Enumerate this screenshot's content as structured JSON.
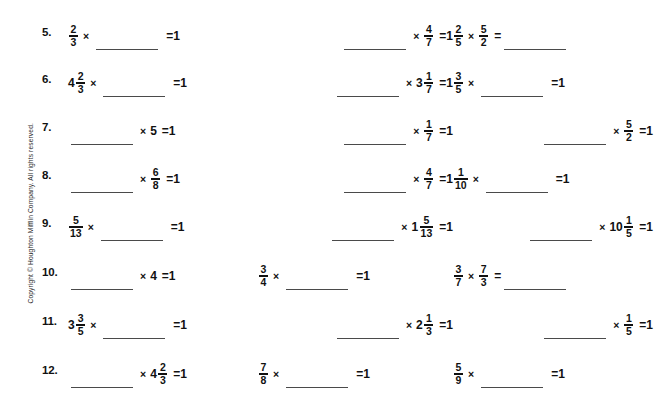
{
  "page": {
    "background_color": "#ffffff",
    "text_color": "#111111",
    "rule_color": "#4a4a4a"
  },
  "copyright": {
    "text": "Copyright © Houghton Mifflin Company. All rights reserved.",
    "orientation": "vertical-rotated-90-ccw"
  },
  "worksheet": {
    "blank_label": "",
    "multiply_symbol": "×",
    "equals_symbol": "=",
    "result_value": "1",
    "rows": [
      {
        "number": "5.",
        "columns": [
          {
            "id": "5a",
            "parts": [
              {
                "kind": "fraction",
                "numerator": "2",
                "denominator": "3"
              },
              {
                "kind": "op",
                "text": "×"
              },
              {
                "kind": "blank"
              },
              {
                "kind": "eq",
                "text": "="
              },
              {
                "kind": "number",
                "text": "1"
              }
            ]
          },
          {
            "id": "5b",
            "align": "right",
            "parts": [
              {
                "kind": "blank"
              },
              {
                "kind": "op",
                "text": "×"
              },
              {
                "kind": "fraction",
                "numerator": "4",
                "denominator": "7"
              },
              {
                "kind": "eq",
                "text": "="
              },
              {
                "kind": "number",
                "text": "1"
              }
            ]
          },
          {
            "id": "5c",
            "parts": [
              {
                "kind": "fraction",
                "numerator": "2",
                "denominator": "5"
              },
              {
                "kind": "op",
                "text": "×"
              },
              {
                "kind": "fraction",
                "numerator": "5",
                "denominator": "2"
              },
              {
                "kind": "eq",
                "text": "="
              },
              {
                "kind": "blank"
              }
            ]
          }
        ]
      },
      {
        "number": "6.",
        "columns": [
          {
            "id": "6a",
            "parts": [
              {
                "kind": "mixed",
                "whole": "4",
                "numerator": "2",
                "denominator": "3"
              },
              {
                "kind": "op",
                "text": "×"
              },
              {
                "kind": "blank"
              },
              {
                "kind": "eq",
                "text": "="
              },
              {
                "kind": "number",
                "text": "1"
              }
            ]
          },
          {
            "id": "6b",
            "align": "right",
            "parts": [
              {
                "kind": "blank"
              },
              {
                "kind": "op",
                "text": "×"
              },
              {
                "kind": "mixed",
                "whole": "3",
                "numerator": "1",
                "denominator": "7"
              },
              {
                "kind": "eq",
                "text": "="
              },
              {
                "kind": "number",
                "text": "1"
              }
            ]
          },
          {
            "id": "6c",
            "parts": [
              {
                "kind": "fraction",
                "numerator": "3",
                "denominator": "5"
              },
              {
                "kind": "op",
                "text": "×"
              },
              {
                "kind": "blank"
              },
              {
                "kind": "eq",
                "text": "="
              },
              {
                "kind": "number",
                "text": "1"
              }
            ]
          }
        ]
      },
      {
        "number": "7.",
        "columns": [
          {
            "id": "7a",
            "parts": [
              {
                "kind": "blank"
              },
              {
                "kind": "op",
                "text": "×"
              },
              {
                "kind": "number",
                "text": "5"
              },
              {
                "kind": "eq",
                "text": "="
              },
              {
                "kind": "number",
                "text": "1"
              }
            ]
          },
          {
            "id": "7b",
            "align": "right",
            "parts": [
              {
                "kind": "blank"
              },
              {
                "kind": "op",
                "text": "×"
              },
              {
                "kind": "fraction",
                "numerator": "1",
                "denominator": "7"
              },
              {
                "kind": "eq",
                "text": "="
              },
              {
                "kind": "number",
                "text": "1"
              }
            ]
          },
          {
            "id": "7c",
            "align": "right",
            "parts": [
              {
                "kind": "blank"
              },
              {
                "kind": "op",
                "text": "×"
              },
              {
                "kind": "fraction",
                "numerator": "5",
                "denominator": "2"
              },
              {
                "kind": "eq",
                "text": "="
              },
              {
                "kind": "number",
                "text": "1"
              }
            ]
          }
        ]
      },
      {
        "number": "8.",
        "columns": [
          {
            "id": "8a",
            "parts": [
              {
                "kind": "blank"
              },
              {
                "kind": "op",
                "text": "×"
              },
              {
                "kind": "fraction",
                "numerator": "6",
                "denominator": "8"
              },
              {
                "kind": "eq",
                "text": "="
              },
              {
                "kind": "number",
                "text": "1"
              }
            ]
          },
          {
            "id": "8b",
            "align": "right",
            "parts": [
              {
                "kind": "blank"
              },
              {
                "kind": "op",
                "text": "×"
              },
              {
                "kind": "fraction",
                "numerator": "4",
                "denominator": "7"
              },
              {
                "kind": "eq",
                "text": "="
              },
              {
                "kind": "number",
                "text": "1"
              }
            ]
          },
          {
            "id": "8c",
            "parts": [
              {
                "kind": "fraction",
                "numerator": "1",
                "denominator": "10"
              },
              {
                "kind": "op",
                "text": "×"
              },
              {
                "kind": "blank"
              },
              {
                "kind": "eq",
                "text": "="
              },
              {
                "kind": "number",
                "text": "1"
              }
            ]
          }
        ]
      },
      {
        "number": "9.",
        "columns": [
          {
            "id": "9a",
            "parts": [
              {
                "kind": "fraction",
                "numerator": "5",
                "denominator": "13"
              },
              {
                "kind": "op",
                "text": "×"
              },
              {
                "kind": "blank"
              },
              {
                "kind": "eq",
                "text": "="
              },
              {
                "kind": "number",
                "text": "1"
              }
            ]
          },
          {
            "id": "9b",
            "align": "right",
            "parts": [
              {
                "kind": "blank"
              },
              {
                "kind": "op",
                "text": "×"
              },
              {
                "kind": "mixed",
                "whole": "1",
                "numerator": "5",
                "denominator": "13"
              },
              {
                "kind": "eq",
                "text": "="
              },
              {
                "kind": "number",
                "text": "1"
              }
            ]
          },
          {
            "id": "9c",
            "align": "right",
            "parts": [
              {
                "kind": "blank"
              },
              {
                "kind": "op",
                "text": "×"
              },
              {
                "kind": "mixed",
                "whole": "10",
                "numerator": "1",
                "denominator": "5"
              },
              {
                "kind": "eq",
                "text": "="
              },
              {
                "kind": "number",
                "text": "1"
              }
            ]
          }
        ]
      },
      {
        "number": "10.",
        "columns": [
          {
            "id": "10a",
            "parts": [
              {
                "kind": "blank"
              },
              {
                "kind": "op",
                "text": "×"
              },
              {
                "kind": "number",
                "text": "4"
              },
              {
                "kind": "eq",
                "text": "="
              },
              {
                "kind": "number",
                "text": "1"
              }
            ]
          },
          {
            "id": "10b",
            "parts": [
              {
                "kind": "fraction",
                "numerator": "3",
                "denominator": "4"
              },
              {
                "kind": "op",
                "text": "×"
              },
              {
                "kind": "blank"
              },
              {
                "kind": "eq",
                "text": "="
              },
              {
                "kind": "number",
                "text": "1"
              }
            ]
          },
          {
            "id": "10c",
            "parts": [
              {
                "kind": "fraction",
                "numerator": "3",
                "denominator": "7"
              },
              {
                "kind": "op",
                "text": "×"
              },
              {
                "kind": "fraction",
                "numerator": "7",
                "denominator": "3"
              },
              {
                "kind": "eq",
                "text": "="
              },
              {
                "kind": "blank"
              }
            ]
          }
        ]
      },
      {
        "number": "11.",
        "columns": [
          {
            "id": "11a",
            "parts": [
              {
                "kind": "mixed",
                "whole": "3",
                "numerator": "3",
                "denominator": "5"
              },
              {
                "kind": "op",
                "text": "×"
              },
              {
                "kind": "blank"
              },
              {
                "kind": "eq",
                "text": "="
              },
              {
                "kind": "number",
                "text": "1"
              }
            ]
          },
          {
            "id": "11b",
            "align": "right",
            "parts": [
              {
                "kind": "blank"
              },
              {
                "kind": "op",
                "text": "×"
              },
              {
                "kind": "mixed",
                "whole": "2",
                "numerator": "1",
                "denominator": "3"
              },
              {
                "kind": "eq",
                "text": "="
              },
              {
                "kind": "number",
                "text": "1"
              }
            ]
          },
          {
            "id": "11c",
            "align": "right",
            "parts": [
              {
                "kind": "blank"
              },
              {
                "kind": "op",
                "text": "×"
              },
              {
                "kind": "fraction",
                "numerator": "1",
                "denominator": "5"
              },
              {
                "kind": "eq",
                "text": "="
              },
              {
                "kind": "number",
                "text": "1"
              }
            ]
          }
        ]
      },
      {
        "number": "12.",
        "columns": [
          {
            "id": "12a",
            "parts": [
              {
                "kind": "blank"
              },
              {
                "kind": "op",
                "text": "×"
              },
              {
                "kind": "mixed",
                "whole": "4",
                "numerator": "2",
                "denominator": "3"
              },
              {
                "kind": "eq",
                "text": "="
              },
              {
                "kind": "number",
                "text": "1"
              }
            ]
          },
          {
            "id": "12b",
            "parts": [
              {
                "kind": "fraction",
                "numerator": "7",
                "denominator": "8"
              },
              {
                "kind": "op",
                "text": "×"
              },
              {
                "kind": "blank"
              },
              {
                "kind": "eq",
                "text": "="
              },
              {
                "kind": "number",
                "text": "1"
              }
            ]
          },
          {
            "id": "12c",
            "parts": [
              {
                "kind": "fraction",
                "numerator": "5",
                "denominator": "9"
              },
              {
                "kind": "op",
                "text": "×"
              },
              {
                "kind": "blank"
              },
              {
                "kind": "eq",
                "text": "="
              },
              {
                "kind": "number",
                "text": "1"
              }
            ]
          }
        ]
      }
    ]
  }
}
